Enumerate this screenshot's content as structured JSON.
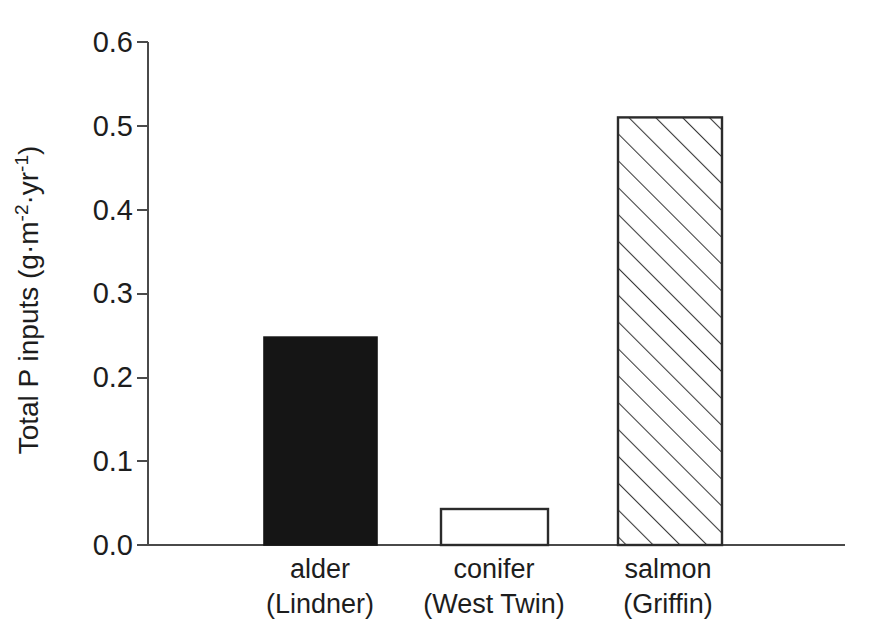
{
  "chart_data": {
    "type": "bar",
    "title": "",
    "subtitle": "",
    "xlabel": "",
    "ylabel": "Total P inputs (g·m⁻²·yr⁻¹)",
    "ylabel_parts": {
      "lead": "Total P inputs (g·m",
      "sup1": "-2",
      "mid": "·yr",
      "sup2": "-1",
      "tail": ")"
    },
    "categories": [
      "alder\n(Lindner)",
      "conifer\n(West Twin)",
      "salmon\n(Griffin)"
    ],
    "category_lines": [
      [
        "alder",
        "(Lindner)"
      ],
      [
        "conifer",
        "(West Twin)"
      ],
      [
        "salmon",
        "(Griffin)"
      ]
    ],
    "values": [
      0.248,
      0.043,
      0.51
    ],
    "ylim": [
      0.0,
      0.6
    ],
    "xlim": [
      0,
      3
    ],
    "yticks": [
      0.0,
      0.1,
      0.2,
      0.3,
      0.4,
      0.5,
      0.6
    ],
    "ytick_labels": [
      "0.0",
      "0.1",
      "0.2",
      "0.3",
      "0.4",
      "0.5",
      "0.6"
    ],
    "grid": false,
    "legend": null,
    "legend_position": "none",
    "bar_styles": [
      {
        "name": "alder-bar",
        "fill": "solid-black",
        "fill_color": "#151515",
        "edge_color": "#151515"
      },
      {
        "name": "conifer-bar",
        "fill": "empty-white",
        "fill_color": "#ffffff",
        "edge_color": "#2b2b2b"
      },
      {
        "name": "salmon-bar",
        "fill": "diagonal-hatch",
        "fill_color": "#ffffff",
        "edge_color": "#2b2b2b",
        "hatch_direction": "forward-slash"
      }
    ],
    "annotations": []
  },
  "figure": {
    "background": "#ffffff",
    "axis_color": "#4a4a4a"
  }
}
